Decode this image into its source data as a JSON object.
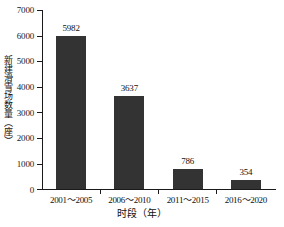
{
  "chart_data": {
    "type": "bar",
    "title": "",
    "subtitle": "",
    "xlabel": "时段（年）",
    "ylabel": "新建滑雪场数量（座）",
    "categories": [
      "2001～2005",
      "2006～2010",
      "2011～2015",
      "2016～2020"
    ],
    "values": [
      5982,
      3637,
      786,
      354
    ],
    "value_labels": [
      "5982",
      "3637",
      "786",
      "354"
    ],
    "ylim": [
      0,
      7000
    ],
    "ytick_step": 1000,
    "ytick_labels": [
      "0",
      "1000",
      "2000",
      "3000",
      "4000",
      "5000",
      "6000",
      "7000"
    ],
    "grid": false,
    "legend": false,
    "legend_position": "none",
    "bar_color": "#333333",
    "axis_color": "#1a1a1a",
    "text_color": "#111111"
  }
}
